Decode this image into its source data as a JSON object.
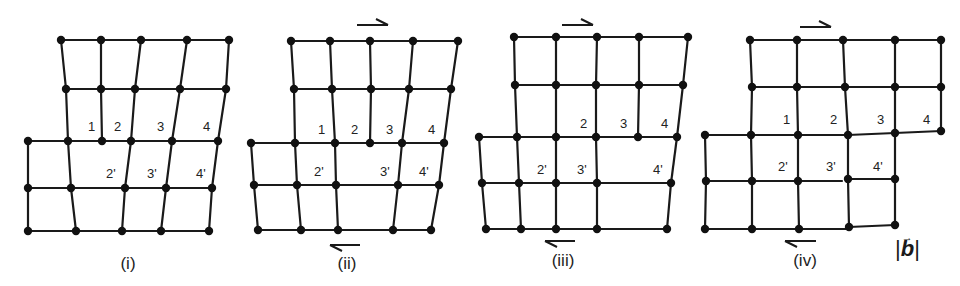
{
  "figure": {
    "colors": {
      "line": "#1a1a1a",
      "node": "#111111",
      "background": "#ffffff"
    },
    "burgers_vector_label": {
      "bar_left": "|",
      "symbol": "b",
      "bar_right": "|"
    },
    "panels": [
      {
        "caption": "(i)",
        "caption_pos": [
          128,
          269
        ],
        "nodes": [
          [
            61,
            40
          ],
          [
            101,
            40
          ],
          [
            141,
            40
          ],
          [
            187,
            40
          ],
          [
            229,
            40
          ],
          [
            66,
            89
          ],
          [
            101,
            89
          ],
          [
            135,
            89
          ],
          [
            180,
            89
          ],
          [
            226,
            89
          ],
          [
            28,
            141
          ],
          [
            68,
            141
          ],
          [
            102,
            141
          ],
          [
            131,
            141
          ],
          [
            172,
            141
          ],
          [
            218,
            141
          ],
          [
            28,
            188
          ],
          [
            71,
            188
          ],
          [
            125,
            188
          ],
          [
            166,
            188
          ],
          [
            212,
            188
          ],
          [
            28,
            231
          ],
          [
            76,
            231
          ],
          [
            122,
            231
          ],
          [
            161,
            231
          ],
          [
            209,
            231
          ]
        ],
        "edges": [
          [
            61,
            40,
            229,
            40
          ],
          [
            66,
            89,
            226,
            89
          ],
          [
            28,
            141,
            218,
            141
          ],
          [
            28,
            188,
            212,
            188
          ],
          [
            28,
            231,
            209,
            231
          ],
          [
            61,
            40,
            66,
            89
          ],
          [
            66,
            89,
            68,
            141
          ],
          [
            68,
            141,
            71,
            188
          ],
          [
            71,
            188,
            76,
            231
          ],
          [
            101,
            40,
            101,
            89
          ],
          [
            101,
            89,
            102,
            141
          ],
          [
            141,
            40,
            135,
            89
          ],
          [
            135,
            89,
            131,
            141
          ],
          [
            131,
            141,
            125,
            188
          ],
          [
            125,
            188,
            122,
            231
          ],
          [
            187,
            40,
            180,
            89
          ],
          [
            180,
            89,
            172,
            141
          ],
          [
            172,
            141,
            166,
            188
          ],
          [
            166,
            188,
            161,
            231
          ],
          [
            229,
            40,
            226,
            89
          ],
          [
            226,
            89,
            218,
            141
          ],
          [
            218,
            141,
            212,
            188
          ],
          [
            212,
            188,
            209,
            231
          ],
          [
            28,
            141,
            28,
            188
          ],
          [
            28,
            188,
            28,
            231
          ]
        ],
        "labels": [
          {
            "text": "1",
            "x": 88,
            "y": 131
          },
          {
            "text": "2",
            "x": 114,
            "y": 131
          },
          {
            "text": "3",
            "x": 157,
            "y": 131
          },
          {
            "text": "4",
            "x": 203,
            "y": 131
          },
          {
            "text": "2'",
            "x": 106,
            "y": 178
          },
          {
            "text": "3'",
            "x": 147,
            "y": 178
          },
          {
            "text": "4'",
            "x": 196,
            "y": 178
          }
        ],
        "arrows": []
      },
      {
        "caption": "(ii)",
        "caption_pos": [
          347,
          269
        ],
        "nodes": [
          [
            291,
            41
          ],
          [
            330,
            41
          ],
          [
            370,
            41
          ],
          [
            413,
            41
          ],
          [
            458,
            41
          ],
          [
            294,
            89
          ],
          [
            332,
            89
          ],
          [
            371,
            89
          ],
          [
            409,
            89
          ],
          [
            451,
            89
          ],
          [
            251,
            143
          ],
          [
            295,
            143
          ],
          [
            335,
            143
          ],
          [
            370,
            143
          ],
          [
            402,
            143
          ],
          [
            444,
            143
          ],
          [
            254,
            185
          ],
          [
            297,
            185
          ],
          [
            336,
            185
          ],
          [
            398,
            185
          ],
          [
            439,
            185
          ],
          [
            258,
            230
          ],
          [
            301,
            230
          ],
          [
            338,
            230
          ],
          [
            393,
            230
          ],
          [
            431,
            230
          ]
        ],
        "edges": [
          [
            291,
            41,
            458,
            41
          ],
          [
            294,
            89,
            451,
            89
          ],
          [
            251,
            143,
            444,
            143
          ],
          [
            254,
            185,
            439,
            185
          ],
          [
            258,
            230,
            431,
            230
          ],
          [
            291,
            41,
            294,
            89
          ],
          [
            294,
            89,
            295,
            143
          ],
          [
            295,
            143,
            297,
            185
          ],
          [
            297,
            185,
            301,
            230
          ],
          [
            330,
            41,
            332,
            89
          ],
          [
            332,
            89,
            335,
            143
          ],
          [
            335,
            143,
            336,
            185
          ],
          [
            336,
            185,
            338,
            230
          ],
          [
            370,
            41,
            371,
            89
          ],
          [
            371,
            89,
            370,
            143
          ],
          [
            413,
            41,
            409,
            89
          ],
          [
            409,
            89,
            402,
            143
          ],
          [
            402,
            143,
            398,
            185
          ],
          [
            398,
            185,
            393,
            230
          ],
          [
            458,
            41,
            451,
            89
          ],
          [
            451,
            89,
            444,
            143
          ],
          [
            444,
            143,
            439,
            185
          ],
          [
            439,
            185,
            431,
            230
          ],
          [
            251,
            143,
            254,
            185
          ],
          [
            254,
            185,
            258,
            230
          ]
        ],
        "labels": [
          {
            "text": "1",
            "x": 318,
            "y": 134
          },
          {
            "text": "2",
            "x": 351,
            "y": 134
          },
          {
            "text": "3",
            "x": 386,
            "y": 134
          },
          {
            "text": "4",
            "x": 428,
            "y": 134
          },
          {
            "text": "2'",
            "x": 314,
            "y": 176
          },
          {
            "text": "3'",
            "x": 380,
            "y": 176
          },
          {
            "text": "4'",
            "x": 419,
            "y": 176
          }
        ],
        "arrows": [
          {
            "dir": "right",
            "x1": 357,
            "x2": 388,
            "y": 25
          },
          {
            "dir": "left",
            "x1": 330,
            "x2": 360,
            "y": 245
          }
        ]
      },
      {
        "caption": "(iii)",
        "caption_pos": [
          563,
          266
        ],
        "nodes": [
          [
            514,
            37
          ],
          [
            556,
            37
          ],
          [
            597,
            37
          ],
          [
            639,
            37
          ],
          [
            688,
            37
          ],
          [
            515,
            85
          ],
          [
            556,
            85
          ],
          [
            596,
            85
          ],
          [
            639,
            85
          ],
          [
            683,
            85
          ],
          [
            479,
            137
          ],
          [
            517,
            137
          ],
          [
            556,
            137
          ],
          [
            596,
            137
          ],
          [
            638,
            137
          ],
          [
            677,
            137
          ],
          [
            482,
            183
          ],
          [
            519,
            183
          ],
          [
            556,
            183
          ],
          [
            597,
            183
          ],
          [
            671,
            183
          ],
          [
            486,
            229
          ],
          [
            521,
            229
          ],
          [
            556,
            229
          ],
          [
            597,
            229
          ],
          [
            667,
            229
          ]
        ],
        "edges": [
          [
            514,
            37,
            688,
            37
          ],
          [
            515,
            85,
            683,
            85
          ],
          [
            479,
            137,
            677,
            137
          ],
          [
            482,
            183,
            671,
            183
          ],
          [
            486,
            229,
            667,
            229
          ],
          [
            514,
            37,
            515,
            85
          ],
          [
            515,
            85,
            517,
            137
          ],
          [
            517,
            137,
            519,
            183
          ],
          [
            519,
            183,
            521,
            229
          ],
          [
            556,
            37,
            556,
            85
          ],
          [
            556,
            85,
            556,
            137
          ],
          [
            556,
            137,
            556,
            183
          ],
          [
            556,
            183,
            556,
            229
          ],
          [
            597,
            37,
            596,
            85
          ],
          [
            596,
            85,
            596,
            137
          ],
          [
            596,
            137,
            597,
            183
          ],
          [
            597,
            183,
            597,
            229
          ],
          [
            639,
            37,
            639,
            85
          ],
          [
            639,
            85,
            638,
            137
          ],
          [
            688,
            37,
            683,
            85
          ],
          [
            683,
            85,
            677,
            137
          ],
          [
            677,
            137,
            671,
            183
          ],
          [
            671,
            183,
            667,
            229
          ],
          [
            479,
            137,
            482,
            183
          ],
          [
            482,
            183,
            486,
            229
          ]
        ],
        "labels": [
          {
            "text": "2",
            "x": 580,
            "y": 128
          },
          {
            "text": "3",
            "x": 620,
            "y": 128
          },
          {
            "text": "4",
            "x": 661,
            "y": 128
          },
          {
            "text": "2'",
            "x": 537,
            "y": 174
          },
          {
            "text": "3'",
            "x": 577,
            "y": 174
          },
          {
            "text": "4'",
            "x": 653,
            "y": 174
          }
        ],
        "arrows": [
          {
            "dir": "right",
            "x1": 562,
            "x2": 593,
            "y": 25
          },
          {
            "dir": "left",
            "x1": 545,
            "x2": 575,
            "y": 241
          }
        ]
      },
      {
        "caption": "(iv)",
        "caption_pos": [
          805,
          266
        ],
        "nodes": [
          [
            750,
            40
          ],
          [
            797,
            40
          ],
          [
            843,
            40
          ],
          [
            895,
            40
          ],
          [
            941,
            40
          ],
          [
            752,
            87
          ],
          [
            797,
            87
          ],
          [
            845,
            87
          ],
          [
            895,
            87
          ],
          [
            941,
            87
          ],
          [
            705,
            135
          ],
          [
            751,
            135
          ],
          [
            798,
            135
          ],
          [
            848,
            135
          ],
          [
            895,
            133
          ],
          [
            941,
            131
          ],
          [
            706,
            181
          ],
          [
            752,
            181
          ],
          [
            798,
            181
          ],
          [
            848,
            179
          ],
          [
            895,
            179
          ],
          [
            705,
            229
          ],
          [
            752,
            229
          ],
          [
            799,
            229
          ],
          [
            849,
            227
          ],
          [
            895,
            225
          ]
        ],
        "edges": [
          [
            750,
            40,
            941,
            40
          ],
          [
            752,
            87,
            941,
            87
          ],
          [
            705,
            135,
            848,
            135
          ],
          [
            848,
            135,
            895,
            133
          ],
          [
            895,
            133,
            941,
            131
          ],
          [
            706,
            181,
            842,
            181
          ],
          [
            848,
            179,
            895,
            179
          ],
          [
            705,
            229,
            849,
            229
          ],
          [
            849,
            227,
            895,
            225
          ],
          [
            750,
            40,
            752,
            87
          ],
          [
            752,
            87,
            751,
            135
          ],
          [
            751,
            135,
            752,
            181
          ],
          [
            752,
            181,
            752,
            229
          ],
          [
            797,
            40,
            797,
            87
          ],
          [
            797,
            87,
            798,
            135
          ],
          [
            798,
            135,
            798,
            181
          ],
          [
            798,
            181,
            799,
            229
          ],
          [
            843,
            40,
            845,
            87
          ],
          [
            845,
            87,
            848,
            135
          ],
          [
            848,
            135,
            848,
            179
          ],
          [
            848,
            179,
            849,
            227
          ],
          [
            895,
            40,
            895,
            87
          ],
          [
            895,
            87,
            895,
            133
          ],
          [
            895,
            133,
            895,
            179
          ],
          [
            895,
            179,
            895,
            225
          ],
          [
            941,
            40,
            941,
            87
          ],
          [
            941,
            87,
            941,
            131
          ],
          [
            705,
            135,
            706,
            181
          ],
          [
            706,
            181,
            705,
            229
          ]
        ],
        "labels": [
          {
            "text": "1",
            "x": 783,
            "y": 124
          },
          {
            "text": "2",
            "x": 830,
            "y": 124
          },
          {
            "text": "3",
            "x": 877,
            "y": 124
          },
          {
            "text": "4",
            "x": 923,
            "y": 124
          },
          {
            "text": "2'",
            "x": 778,
            "y": 171
          },
          {
            "text": "3'",
            "x": 826,
            "y": 171
          },
          {
            "text": "4'",
            "x": 873,
            "y": 171
          }
        ],
        "arrows": [
          {
            "dir": "right",
            "x1": 800,
            "x2": 831,
            "y": 27
          },
          {
            "dir": "left",
            "x1": 785,
            "x2": 816,
            "y": 241
          }
        ]
      }
    ]
  }
}
